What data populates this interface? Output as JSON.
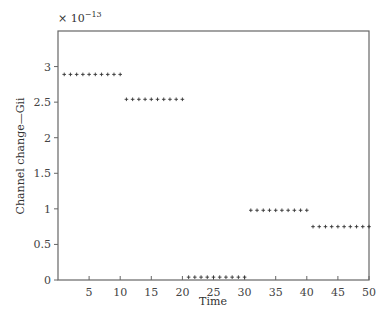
{
  "chart_data": {
    "type": "scatter",
    "title": "",
    "xlabel": "Time",
    "ylabel": "Channel change—Gii",
    "y_multiplier_label": "× 10",
    "y_multiplier_exponent": "−13",
    "xlim": [
      0,
      50
    ],
    "ylim": [
      0,
      3.5
    ],
    "grid": false,
    "legend": null,
    "x_ticks": [
      5,
      10,
      15,
      20,
      25,
      30,
      35,
      40,
      45,
      50
    ],
    "y_ticks": [
      0,
      0.5,
      1,
      1.5,
      2,
      2.5,
      3
    ],
    "y_tick_labels": [
      "0",
      "0.5",
      "1",
      "1.5",
      "2",
      "2.5",
      "3"
    ],
    "marker": "+",
    "series": [
      {
        "name": "Gii",
        "x": [
          1,
          2,
          3,
          4,
          5,
          6,
          7,
          8,
          9,
          10,
          11,
          12,
          13,
          14,
          15,
          16,
          17,
          18,
          19,
          20,
          21,
          22,
          23,
          24,
          25,
          26,
          27,
          28,
          29,
          30,
          31,
          32,
          33,
          34,
          35,
          36,
          37,
          38,
          39,
          40,
          41,
          42,
          43,
          44,
          45,
          46,
          47,
          48,
          49,
          50
        ],
        "values": [
          2.89,
          2.89,
          2.89,
          2.89,
          2.89,
          2.89,
          2.89,
          2.89,
          2.89,
          2.89,
          2.54,
          2.54,
          2.54,
          2.54,
          2.54,
          2.54,
          2.54,
          2.54,
          2.54,
          2.54,
          0.04,
          0.04,
          0.04,
          0.04,
          0.04,
          0.04,
          0.04,
          0.04,
          0.04,
          0.04,
          0.98,
          0.98,
          0.98,
          0.98,
          0.98,
          0.98,
          0.98,
          0.98,
          0.98,
          0.98,
          0.75,
          0.75,
          0.75,
          0.75,
          0.75,
          0.75,
          0.75,
          0.75,
          0.75,
          0.75
        ]
      }
    ]
  },
  "layout": {
    "plot_left": 58,
    "plot_right": 369,
    "plot_top": 31,
    "plot_bottom": 280,
    "axis_color": "#666666",
    "marker_color": "#333333"
  }
}
